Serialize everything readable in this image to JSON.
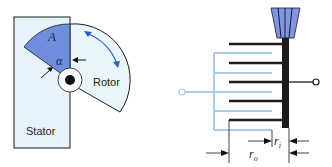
{
  "left_figure": {
    "stator_label": "Stator",
    "rotor_label": "Rotor",
    "area_label": "A",
    "angle_label": "α",
    "colors": {
      "stator_fill": "#e6f3fa",
      "overlap_fill": "#6f8fdc",
      "rotor_fill": "#e9f4fb",
      "rotation_arrow": "#2b5fc8",
      "outline": "#1a1a1a"
    }
  },
  "right_figure": {
    "inner_gap_label": "r",
    "inner_gap_subscript": "i",
    "outer_length_label": "r",
    "outer_length_subscript": "o",
    "colors": {
      "fixed_plates": "#a9cdee",
      "movable_plates": "#1f1a1c",
      "knob": "#7f96e0",
      "knob_stripes": "#1a1a2e"
    }
  }
}
